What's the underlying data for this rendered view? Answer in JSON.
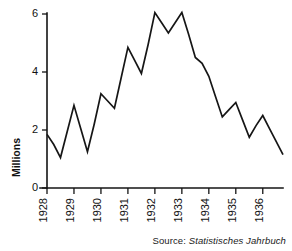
{
  "source": {
    "prefix": "Source:",
    "title": "Statistisches Jahrbuch"
  },
  "chart_data": {
    "type": "line",
    "title": "",
    "subtitle": "",
    "xlabel": "",
    "ylabel": "Millions",
    "xlim": [
      1928.0,
      1936.75
    ],
    "ylim": [
      0,
      6
    ],
    "grid": false,
    "legend": null,
    "y_ticks": [
      0,
      2,
      4,
      6
    ],
    "y_tick_labels": [
      "0",
      "2",
      "4",
      "6"
    ],
    "x_ticks": [
      1928,
      1929,
      1930,
      1931,
      1932,
      1933,
      1934,
      1935,
      1936
    ],
    "x_tick_labels": [
      "1928",
      "1929",
      "1930",
      "1931",
      "1932",
      "1933",
      "1934",
      "1935",
      "1936"
    ],
    "x_tick_rotation": 90,
    "series": [
      {
        "name": "Unemployed",
        "x": [
          1928.0,
          1928.25,
          1928.5,
          1928.75,
          1929.0,
          1929.25,
          1929.5,
          1929.75,
          1930.0,
          1930.25,
          1930.5,
          1930.75,
          1931.0,
          1931.25,
          1931.5,
          1931.75,
          1932.0,
          1932.25,
          1932.5,
          1932.75,
          1933.0,
          1933.25,
          1933.5,
          1933.75,
          1934.0,
          1934.25,
          1934.5,
          1934.75,
          1935.0,
          1935.25,
          1935.5,
          1935.75,
          1936.0,
          1936.25,
          1936.5,
          1936.75
        ],
        "values": [
          1.85,
          1.5,
          1.05,
          1.95,
          2.85,
          2.05,
          1.25,
          2.2,
          3.25,
          3.0,
          2.75,
          3.8,
          4.85,
          4.4,
          3.95,
          4.95,
          6.05,
          5.7,
          5.35,
          5.7,
          6.05,
          5.3,
          4.5,
          4.3,
          3.85,
          3.15,
          2.45,
          2.7,
          2.95,
          2.35,
          1.75,
          2.15,
          2.5,
          2.05,
          1.6,
          1.15
        ]
      }
    ]
  }
}
